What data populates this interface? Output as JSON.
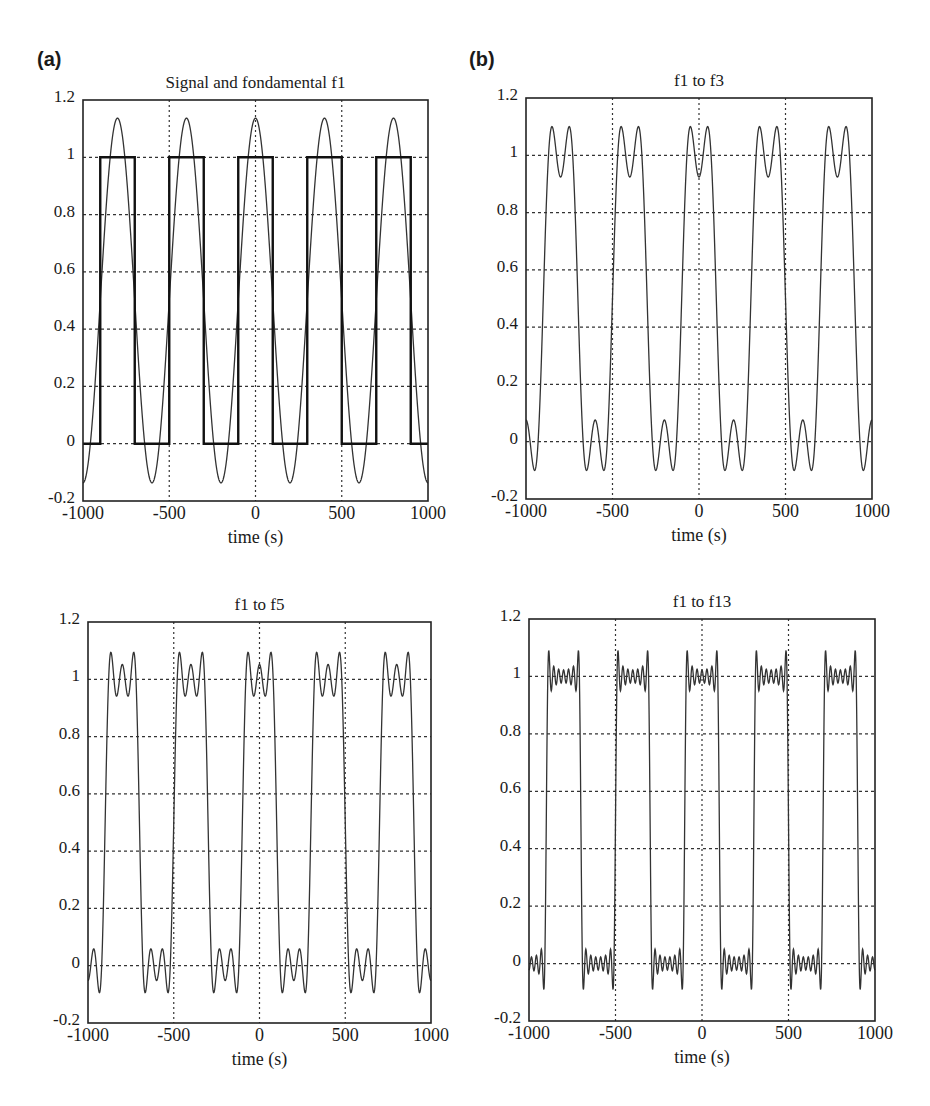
{
  "panel_labels": [
    "(a)",
    "(b)"
  ],
  "chart_data": [
    {
      "type": "line",
      "title": "Signal and fondamental f1",
      "xlabel": "time (s)",
      "ylabel": "",
      "xlim": [
        -1000,
        1000
      ],
      "ylim": [
        -0.2,
        1.2
      ],
      "xticks": [
        -1000,
        -500,
        0,
        500,
        1000
      ],
      "yticks": [
        -0.2,
        0,
        0.2,
        0.4,
        0.6,
        0.8,
        1,
        1.2
      ],
      "ytick_labels": [
        "-0.2",
        "0",
        "0.2",
        "0.4",
        "0.6",
        "0.8",
        "1",
        "1.2"
      ],
      "grid": true,
      "period_s": 400,
      "harmonics": [
        1
      ],
      "show_square": true,
      "series": [
        {
          "name": "square signal",
          "description": "square wave 0/1, period 400 s, high from -900 to -700, -500 to -300, -100 to 100, 300 to 500, 700 to 900"
        },
        {
          "name": "fundamental f1",
          "description": "0.5 + 0.637 cos(2πt/400), peaks 1.14 at t=-800,-400,0,400,800; minima -0.14"
        }
      ],
      "box": {
        "left": 83,
        "top": 100,
        "right": 428,
        "bottom": 501
      }
    },
    {
      "type": "line",
      "title": "f1 to f3",
      "xlabel": "time (s)",
      "ylabel": "",
      "xlim": [
        -1000,
        1000
      ],
      "ylim": [
        -0.2,
        1.2
      ],
      "xticks": [
        -1000,
        -500,
        0,
        500,
        1000
      ],
      "yticks": [
        -0.2,
        0,
        0.2,
        0.4,
        0.6,
        0.8,
        1,
        1.2
      ],
      "ytick_labels": [
        "-0.2",
        "0",
        "0.2",
        "0.4",
        "0.6",
        "0.8",
        "1",
        "1.2"
      ],
      "grid": true,
      "period_s": 400,
      "harmonics": [
        1,
        3
      ],
      "show_square": false,
      "series": [
        {
          "name": "sum f1..f3",
          "description": "double-peaked plateau, peaks ~1.10, dip ~0.92; lows ~-0.10 with bump ~0.08"
        }
      ],
      "box": {
        "left": 526,
        "top": 98,
        "right": 872,
        "bottom": 499
      }
    },
    {
      "type": "line",
      "title": "f1 to f5",
      "xlabel": "time (s)",
      "ylabel": "",
      "xlim": [
        -1000,
        1000
      ],
      "ylim": [
        -0.2,
        1.2
      ],
      "xticks": [
        -1000,
        -500,
        0,
        500,
        1000
      ],
      "yticks": [
        -0.2,
        0,
        0.2,
        0.4,
        0.6,
        0.8,
        1,
        1.2
      ],
      "ytick_labels": [
        "-0.2",
        "0",
        "0.2",
        "0.4",
        "0.6",
        "0.8",
        "1",
        "1.2"
      ],
      "grid": true,
      "period_s": 400,
      "harmonics": [
        1,
        3,
        5
      ],
      "show_square": false,
      "series": [
        {
          "name": "sum f1..f5",
          "description": "triple-peaked plateau, peaks ~1.10, ripple ~0.95-1.06"
        }
      ],
      "box": {
        "left": 88,
        "top": 622,
        "right": 431,
        "bottom": 1023
      }
    },
    {
      "type": "line",
      "title": "f1 to f13",
      "xlabel": "time (s)",
      "ylabel": "",
      "xlim": [
        -1000,
        1000
      ],
      "ylim": [
        -0.2,
        1.2
      ],
      "xticks": [
        -1000,
        -500,
        0,
        500,
        1000
      ],
      "yticks": [
        -0.2,
        0,
        0.2,
        0.4,
        0.6,
        0.8,
        1,
        1.2
      ],
      "ytick_labels": [
        "-0.2",
        "0",
        "0.2",
        "0.4",
        "0.6",
        "0.8",
        "1",
        "1.2"
      ],
      "grid": true,
      "period_s": 400,
      "harmonics": [
        1,
        3,
        5,
        7,
        9,
        11,
        13
      ],
      "show_square": false,
      "series": [
        {
          "name": "sum f1..f13",
          "description": "near-square wave with Gibbs overshoot ~1.09, fine ripple around 1 and 0"
        }
      ],
      "box": {
        "left": 529,
        "top": 619,
        "right": 875,
        "bottom": 1021
      }
    }
  ]
}
